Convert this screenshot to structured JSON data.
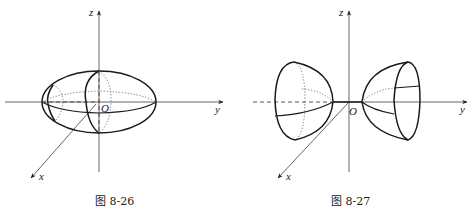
{
  "figures": [
    {
      "id": "fig-8-26",
      "caption": "图 8-26",
      "labels": {
        "z": "z",
        "y": "y",
        "x": "x",
        "origin": "O"
      },
      "shape": "ellipsoid of revolution about y-axis"
    },
    {
      "id": "fig-8-27",
      "caption": "图 8-27",
      "labels": {
        "z": "z",
        "y": "y",
        "x": "x",
        "origin": "O"
      },
      "shape": "two-sheeted hyperboloid of revolution about y-axis"
    }
  ],
  "colors": {
    "line": "#1a1a1a",
    "axis": "#555555",
    "background": "#ffffff"
  }
}
